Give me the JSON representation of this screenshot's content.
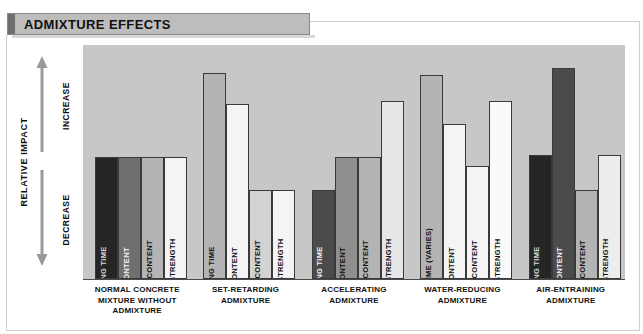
{
  "title": "ADMIXTURE EFFECTS",
  "axes": {
    "y_title": "RELATIVE IMPACT",
    "increase_label": "INCREASE",
    "decrease_label": "DECREASE",
    "up_arrow_icon": "arrow-up-icon",
    "down_arrow_icon": "arrow-down-icon"
  },
  "colors": {
    "plot_background": "#c7c7c7",
    "banner": "#bdbdbd",
    "banner_accent": "#6e6e6e",
    "bar_outline": "#3a3a3a",
    "very_dark": "#252525",
    "dark": "#4b4b4b",
    "medium": "#6f6f6f",
    "light": "#b4b4b4",
    "lighter": "#d2d2d2",
    "white": "#f4f4f4"
  },
  "chart_data": {
    "type": "bar",
    "title": "ADMIXTURE EFFECTS",
    "xlabel": "",
    "ylabel": "RELATIVE IMPACT",
    "ylim": [
      0,
      100
    ],
    "grid": false,
    "legend": "none",
    "note": "Qualitative chart: bar heights express relative impact, no numeric axis ticks.",
    "categories": [
      "NORMAL CONCRETE MIXTURE WITHOUT ADMIXTURE",
      "SET-RETARDING ADMIXTURE",
      "ACCELERATING ADMIXTURE",
      "WATER-REDUCING ADMIXTURE",
      "AIR-ENTRAINING ADMIXTURE"
    ],
    "series": [
      {
        "name": "SETTING TIME",
        "values": [
          55,
          93,
          40,
          92,
          56
        ]
      },
      {
        "name": "AIR CONTENT",
        "values": [
          55,
          79,
          55,
          70,
          95
        ]
      },
      {
        "name": "WATER CONTENT",
        "values": [
          55,
          40,
          55,
          51,
          40
        ]
      },
      {
        "name": "EARLY STRENGTH",
        "values": [
          55,
          40,
          80,
          80,
          56
        ]
      }
    ]
  },
  "groups": [
    {
      "label_lines": [
        "NORMAL CONCRETE",
        "MIXTURE WITHOUT",
        "ADMIXTURE"
      ],
      "bars": [
        {
          "label": "SETTING TIME",
          "value": 55,
          "fill": "#252525",
          "text": "#d8d8d8"
        },
        {
          "label": "AIR CONTENT",
          "value": 55,
          "fill": "#6f6f6f",
          "text": "#f2f2f2"
        },
        {
          "label": "WATER CONTENT",
          "value": 55,
          "fill": "#b4b4b4",
          "text": "#111111"
        },
        {
          "label": "EARLY STRENGTH",
          "value": 55,
          "fill": "#f4f4f4",
          "text": "#111111"
        }
      ]
    },
    {
      "label_lines": [
        "SET-RETARDING",
        "ADMIXTURE"
      ],
      "bars": [
        {
          "label": "SETTING TIME",
          "value": 93,
          "fill": "#b4b4b4",
          "text": "#111111"
        },
        {
          "label": "AIR CONTENT",
          "value": 79,
          "fill": "#f4f4f4",
          "text": "#111111"
        },
        {
          "label": "WATER CONTENT",
          "value": 40,
          "fill": "#d2d2d2",
          "text": "#111111"
        },
        {
          "label": "EARLY STRENGTH",
          "value": 40,
          "fill": "#f4f4f4",
          "text": "#111111"
        }
      ]
    },
    {
      "label_lines": [
        "ACCELERATING",
        "ADMIXTURE"
      ],
      "bars": [
        {
          "label": "SETTING TIME",
          "value": 40,
          "fill": "#4b4b4b",
          "text": "#f2f2f2"
        },
        {
          "label": "AIR CONTENT",
          "value": 55,
          "fill": "#8f8f8f",
          "text": "#111111"
        },
        {
          "label": "WATER CONTENT",
          "value": 55,
          "fill": "#b4b4b4",
          "text": "#111111"
        },
        {
          "label": "EARLY STRENGTH",
          "value": 80,
          "fill": "#e6e6e6",
          "text": "#111111"
        }
      ]
    },
    {
      "label_lines": [
        "WATER-REDUCING",
        "ADMIXTURE"
      ],
      "bars": [
        {
          "label": "SETTING TIME (VARIES)",
          "value": 92,
          "fill": "#b4b4b4",
          "text": "#111111"
        },
        {
          "label": "AIR CONTENT",
          "value": 70,
          "fill": "#f4f4f4",
          "text": "#111111"
        },
        {
          "label": "WATER CONTENT",
          "value": 51,
          "fill": "#f4f4f4",
          "text": "#111111"
        },
        {
          "label": "EARLY STRENGTH",
          "value": 80,
          "fill": "#fafafa",
          "text": "#111111"
        }
      ]
    },
    {
      "label_lines": [
        "AIR-ENTRAINING",
        "ADMIXTURE"
      ],
      "bars": [
        {
          "label": "SETTING TIME",
          "value": 56,
          "fill": "#252525",
          "text": "#d8d8d8"
        },
        {
          "label": "AIR CONTENT",
          "value": 95,
          "fill": "#4b4b4b",
          "text": "#f2f2f2"
        },
        {
          "label": "WATER CONTENT",
          "value": 40,
          "fill": "#b4b4b4",
          "text": "#111111"
        },
        {
          "label": "EARLY STRENGTH",
          "value": 56,
          "fill": "#ededed",
          "text": "#111111"
        }
      ]
    }
  ]
}
